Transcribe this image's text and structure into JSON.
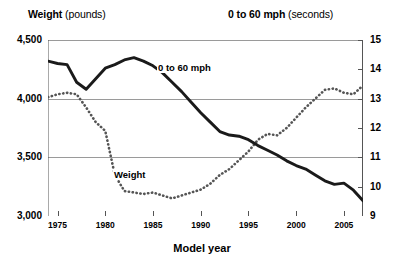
{
  "header": {
    "left_bold": "Weight",
    "left_unit": " (pounds)",
    "right_bold": "0 to 60 mph",
    "right_unit": " (seconds)"
  },
  "axis_titles": {
    "x": "Model year"
  },
  "series_labels": {
    "weight": "Weight",
    "accel": "0 to 60 mph"
  },
  "colors": {
    "weight_line": "#1a1a1a",
    "accel_line": "#555555",
    "grid": "#9a9a9a",
    "axis": "#555555",
    "background": "#ffffff"
  },
  "chart_data": {
    "type": "line",
    "title": "",
    "subtitle": "",
    "xlabel": "Model year",
    "ylabel": "Weight (pounds)",
    "y2label": "0 to 60 mph (seconds)",
    "grid": true,
    "legend_position": "inline-labels",
    "xlim": [
      1974,
      2007
    ],
    "ylim": [
      3000,
      4500
    ],
    "y2lim": [
      9,
      15
    ],
    "xticks": [
      1975,
      1980,
      1985,
      1990,
      1995,
      2000,
      2005
    ],
    "xtick_labels": [
      "1975",
      "1980",
      "1985",
      "1990",
      "1995",
      "2000",
      "2005"
    ],
    "yticks": [
      3000,
      3500,
      4000,
      4500
    ],
    "ytick_labels": [
      "3,000",
      "3,500",
      "4,000",
      "4,500"
    ],
    "y2ticks": [
      9,
      10,
      11,
      12,
      13,
      14,
      15
    ],
    "y2tick_labels": [
      "9",
      "10",
      "11",
      "12",
      "13",
      "14",
      "15"
    ],
    "x": [
      1974,
      1975,
      1976,
      1977,
      1978,
      1979,
      1980,
      1981,
      1982,
      1983,
      1984,
      1985,
      1986,
      1987,
      1988,
      1989,
      1990,
      1991,
      1992,
      1993,
      1994,
      1995,
      1996,
      1997,
      1998,
      1999,
      2000,
      2001,
      2002,
      2003,
      2004,
      2005,
      2006,
      2007
    ],
    "series": [
      {
        "name": "Weight",
        "axis": "left",
        "unit": "pounds",
        "style": "solid",
        "values": [
          4320,
          4300,
          4290,
          4140,
          4080,
          4170,
          4260,
          4290,
          4330,
          4350,
          4320,
          4280,
          4220,
          4140,
          4060,
          3970,
          3880,
          3800,
          3720,
          3690,
          3680,
          3650,
          3600,
          3560,
          3520,
          3470,
          3430,
          3400,
          3350,
          3300,
          3270,
          3280,
          3220,
          3130
        ]
      },
      {
        "name": "0 to 60 mph",
        "axis": "right",
        "unit": "seconds",
        "style": "dotted",
        "values": [
          13.05,
          13.15,
          13.2,
          13.15,
          12.7,
          12.2,
          11.9,
          10.4,
          9.85,
          9.8,
          9.75,
          9.8,
          9.7,
          9.6,
          9.7,
          9.8,
          9.9,
          10.1,
          10.4,
          10.6,
          10.9,
          11.2,
          11.6,
          11.8,
          11.75,
          12.0,
          12.35,
          12.7,
          13.0,
          13.3,
          13.35,
          13.2,
          13.15,
          13.45
        ]
      }
    ],
    "annotations": [
      {
        "text": "Weight",
        "x": 1984,
        "y2_anchor": 10.3
      },
      {
        "text": "0 to 60 mph",
        "x": 1987,
        "y_anchor": 4250
      }
    ]
  }
}
